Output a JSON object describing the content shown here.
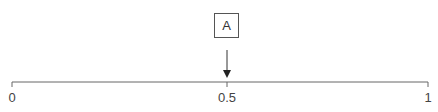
{
  "number_line": {
    "min_label": "0",
    "mid_label": "0.5",
    "max_label": "1"
  },
  "marker": {
    "label": "A",
    "value": "0.5"
  },
  "colors": {
    "line": "#555555",
    "text": "#444444"
  }
}
